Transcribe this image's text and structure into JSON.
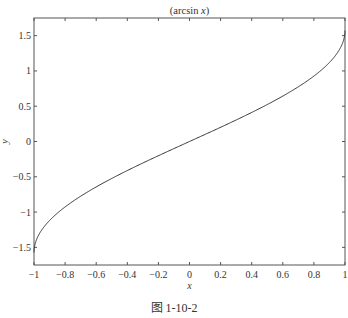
{
  "chart_data": {
    "type": "line",
    "title": "(arcsin x)",
    "title_parts": {
      "prefix": "(arcsin ",
      "var": "x",
      "suffix": ")"
    },
    "xlabel": "x",
    "ylabel": "y",
    "xlim": [
      -1,
      1
    ],
    "ylim": [
      -1.75,
      1.75
    ],
    "xticks": [
      -1,
      -0.8,
      -0.6,
      -0.4,
      -0.2,
      0,
      0.2,
      0.4,
      0.6,
      0.8,
      1
    ],
    "xtick_labels": [
      "-1",
      "-0.8",
      "-0.6",
      "-0.4",
      "-0.2",
      "0",
      "0.2",
      "0.4",
      "0.6",
      "0.8",
      "1"
    ],
    "yticks": [
      -1.5,
      -1,
      -0.5,
      0,
      0.5,
      1,
      1.5
    ],
    "ytick_labels": [
      "-1.5",
      "-1",
      "-0.5",
      "0",
      "0.5",
      "1",
      "1.5"
    ],
    "grid": false,
    "series": [
      {
        "name": "arcsin(x)",
        "function": "arcsin",
        "x_range": [
          -1,
          1
        ],
        "sample_points": [
          [
            -1,
            -1.5708
          ],
          [
            -0.8,
            -0.9273
          ],
          [
            -0.6,
            -0.6435
          ],
          [
            -0.4,
            -0.4115
          ],
          [
            -0.2,
            -0.2014
          ],
          [
            0,
            0
          ],
          [
            0.2,
            0.2014
          ],
          [
            0.4,
            0.4115
          ],
          [
            0.6,
            0.6435
          ],
          [
            0.8,
            0.9273
          ],
          [
            1,
            1.5708
          ]
        ]
      }
    ],
    "line_color": "#333333"
  },
  "caption": "图 1-10-2"
}
